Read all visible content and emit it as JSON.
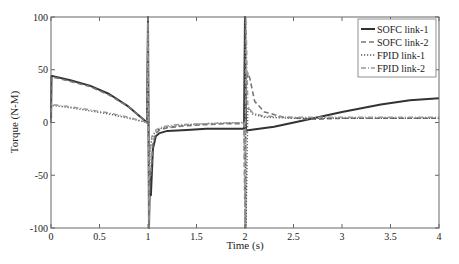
{
  "chart_data": {
    "type": "line",
    "title": "",
    "xlabel": "Time (s)",
    "ylabel": "Torque (N-M)",
    "xlim": [
      0,
      4
    ],
    "ylim": [
      -100,
      100
    ],
    "xticks": [
      0,
      0.5,
      1,
      1.5,
      2,
      2.5,
      3,
      3.5,
      4
    ],
    "xtick_labels": [
      "0",
      "0.5",
      "1",
      "1.5",
      "2",
      "2.5",
      "3",
      "3.5",
      "4"
    ],
    "yticks": [
      -100,
      -50,
      0,
      50,
      100
    ],
    "ytick_labels": [
      "-100",
      "-50",
      "0",
      "50",
      "100"
    ],
    "grid": false,
    "legend_position": "top-right",
    "series": [
      {
        "name": "SOFC link-1",
        "style": "solid",
        "color": "#333333",
        "x": [
          0,
          0.005,
          0.02,
          0.2,
          0.4,
          0.6,
          0.8,
          0.99,
          1.0,
          1.01,
          1.02,
          1.03,
          1.05,
          1.08,
          1.12,
          1.2,
          1.4,
          1.6,
          1.8,
          1.99,
          2.0,
          2.01,
          2.05,
          2.3,
          2.6,
          3.0,
          3.4,
          3.7,
          4.0
        ],
        "y": [
          0,
          44,
          44,
          40,
          35,
          27,
          15,
          0,
          100,
          -100,
          -50,
          -69,
          -25,
          -13,
          -10,
          -8,
          -7,
          -6,
          -6,
          -6,
          100,
          -8,
          -7,
          -4,
          2,
          10,
          17,
          21,
          23
        ]
      },
      {
        "name": "SOFC link-2",
        "style": "dashed",
        "color": "#777777",
        "x": [
          0,
          0.005,
          0.02,
          0.2,
          0.4,
          0.6,
          0.8,
          0.99,
          1.0,
          1.01,
          1.02,
          1.03,
          1.05,
          1.08,
          1.12,
          1.2,
          1.4,
          1.6,
          1.8,
          1.99,
          2.0,
          2.01,
          2.03,
          2.05,
          2.1,
          2.2,
          2.4,
          2.7,
          3.0,
          3.5,
          4.0
        ],
        "y": [
          0,
          43,
          43,
          39,
          34,
          26,
          15,
          0,
          100,
          -100,
          -45,
          -50,
          -20,
          -10,
          -7,
          -5,
          -3,
          -2,
          -1,
          -1,
          -100,
          35,
          47,
          42,
          20,
          10,
          5,
          3,
          4,
          4,
          4
        ]
      },
      {
        "name": "FPID link-1",
        "style": "dotted",
        "color": "#555555",
        "x": [
          0,
          0.005,
          0.02,
          0.2,
          0.4,
          0.6,
          0.8,
          0.99,
          1.0,
          1.01,
          1.02,
          1.04,
          1.08,
          1.15,
          1.3,
          1.6,
          1.99,
          2.0,
          2.01,
          2.03,
          2.08,
          2.2,
          2.5,
          3.0,
          3.5,
          4.0
        ],
        "y": [
          0,
          16,
          16,
          14,
          11,
          8,
          4,
          0,
          100,
          -100,
          -30,
          -15,
          -8,
          -5,
          -3,
          -1,
          0,
          100,
          -100,
          14,
          8,
          5,
          4,
          4,
          4,
          4
        ]
      },
      {
        "name": "FPID link-2",
        "style": "dashdot",
        "color": "#999999",
        "x": [
          0,
          0.005,
          0.02,
          0.2,
          0.4,
          0.6,
          0.8,
          0.99,
          1.0,
          1.01,
          1.02,
          1.04,
          1.08,
          1.15,
          1.3,
          1.6,
          1.99,
          2.0,
          2.01,
          2.03,
          2.08,
          2.2,
          2.5,
          3.0,
          3.5,
          4.0
        ],
        "y": [
          0,
          17,
          17,
          15,
          12,
          9,
          5,
          0,
          100,
          -100,
          -28,
          -13,
          -7,
          -4,
          -2,
          -1,
          0,
          -100,
          100,
          15,
          9,
          6,
          5,
          5,
          5,
          5
        ]
      }
    ]
  }
}
